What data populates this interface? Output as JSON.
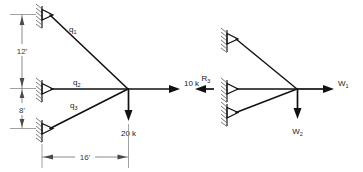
{
  "figure": {
    "background_color": "#ffffff",
    "line_color": "#111111",
    "dimension_color": "#6d6d6d",
    "hatch_color": "#6a6a6a"
  },
  "left_diagram": {
    "name": "actual-truss-with-loads",
    "members": [
      {
        "id": "q1",
        "label": "q₁",
        "from": "top-support",
        "to": "free-node"
      },
      {
        "id": "q2",
        "label": "q₂",
        "from": "middle-support",
        "to": "free-node"
      },
      {
        "id": "q3",
        "label": "q₃",
        "from": "bottom-support",
        "to": "free-node"
      }
    ],
    "supports": [
      {
        "id": "top-support",
        "type": "pin",
        "x_ft": 0,
        "y_label": "top"
      },
      {
        "id": "middle-support",
        "type": "pin",
        "x_ft": 0,
        "y_label": "middle"
      },
      {
        "id": "bottom-support",
        "type": "pin",
        "x_ft": 0,
        "y_label": "bottom"
      }
    ],
    "loads": [
      {
        "id": "horizontal-load",
        "label": "10 k",
        "magnitude": 10,
        "unit": "k",
        "direction": "right"
      },
      {
        "id": "vertical-load",
        "label": "20 k",
        "magnitude": 20,
        "unit": "k",
        "direction": "down"
      }
    ],
    "dimensions": [
      {
        "id": "dim-vertical-upper",
        "label": "12'",
        "value": 12,
        "unit": "ft",
        "orientation": "vertical"
      },
      {
        "id": "dim-vertical-lower",
        "label": "8'",
        "value": 8,
        "unit": "ft",
        "orientation": "vertical"
      },
      {
        "id": "dim-horizontal-span",
        "label": "16'",
        "value": 16,
        "unit": "ft",
        "orientation": "horizontal"
      }
    ]
  },
  "right_diagram": {
    "name": "generalized-truss-with-symbolic-forces",
    "reactions": [
      {
        "id": "reaction-R3",
        "label": "R₃",
        "direction": "left"
      }
    ],
    "loads": [
      {
        "id": "load-W1",
        "label": "W₁",
        "direction": "right"
      },
      {
        "id": "load-W2",
        "label": "W₂",
        "direction": "down"
      }
    ],
    "supports": [
      {
        "id": "top-support",
        "type": "pin"
      },
      {
        "id": "middle-support",
        "type": "pin"
      },
      {
        "id": "bottom-support",
        "type": "pin"
      }
    ]
  }
}
